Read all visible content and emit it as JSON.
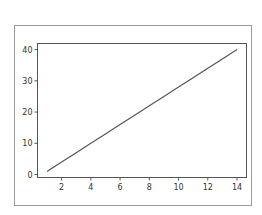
{
  "chart_data": {
    "type": "line",
    "title": "",
    "xlabel": "",
    "ylabel": "",
    "x": [
      1,
      2,
      3,
      4,
      5,
      6,
      7,
      8,
      9,
      10,
      11,
      12,
      13,
      14
    ],
    "series": [
      {
        "name": "",
        "values": [
          1,
          4,
          7,
          10,
          13,
          16,
          19,
          22,
          25,
          28,
          31,
          34,
          37,
          40
        ],
        "color": "#555555"
      }
    ],
    "xticks": [
      2,
      4,
      6,
      8,
      10,
      12,
      14
    ],
    "yticks": [
      0,
      10,
      20,
      30,
      40
    ],
    "xlim": [
      0.35,
      14.65
    ],
    "ylim": [
      -0.95,
      41.95
    ],
    "grid": false,
    "legend": null
  },
  "colors": {
    "frame": "#9a9a9a",
    "axes": "#555555",
    "line": "#555555",
    "text": "#333333"
  }
}
